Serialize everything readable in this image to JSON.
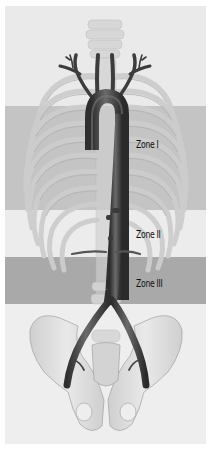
{
  "figure": {
    "colors": {
      "background": "#eaeaea",
      "zone1_band": "#c4c4c4",
      "zone2_band": "#ececec",
      "zone3_band": "#a9a9a9",
      "aorta": "#4a4a4a",
      "bone": "#d8d8d8"
    },
    "zones": [
      {
        "label": "Zone I"
      },
      {
        "label": "Zone II"
      },
      {
        "label": "Zone III"
      }
    ]
  }
}
